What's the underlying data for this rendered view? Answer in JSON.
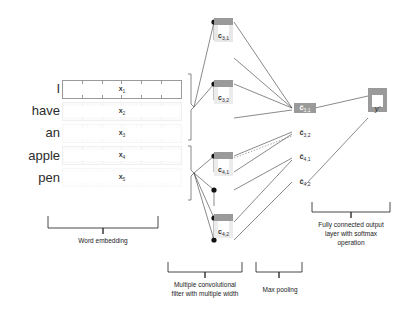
{
  "figure": {
    "background": "#ffffff",
    "ink": "#2f2f2f",
    "block_fill": "#9a9a9a",
    "embed_highlight": "#9a9a9a",
    "embed_faded": "#f2f2f2"
  },
  "input": {
    "words": [
      {
        "text": "I"
      },
      {
        "text": "have"
      },
      {
        "text": "an"
      },
      {
        "text": "apple"
      },
      {
        "text": "pen"
      }
    ]
  },
  "embedding": {
    "caption": "Word embedding",
    "rows": [
      {
        "label": "x",
        "sub": "1",
        "state": "highlighted"
      },
      {
        "label": "x",
        "sub": "2",
        "state": "faded"
      },
      {
        "label": "x",
        "sub": "3",
        "state": "faded"
      },
      {
        "label": "x",
        "sub": "4",
        "state": "faded"
      },
      {
        "label": "x",
        "sub": "5",
        "state": "faded"
      }
    ],
    "cells_per_row": 6
  },
  "convolution": {
    "caption_line1": "Multiple convolutional",
    "caption_line2": "filter with multiple width",
    "blocks": [
      {
        "label": "c",
        "sub": "3,1"
      },
      {
        "label": "c",
        "sub": "3,2"
      },
      {
        "label": "c",
        "sub": "4,1"
      },
      {
        "label": "c",
        "sub": "4,2"
      }
    ]
  },
  "pooling": {
    "caption": "Max pooling",
    "values": [
      {
        "label": "ĉ",
        "sub": "3,1",
        "highlighted": true
      },
      {
        "label": "ĉ",
        "sub": "3,2",
        "highlighted": false
      },
      {
        "label": "ĉ",
        "sub": "4,1",
        "highlighted": false
      },
      {
        "label": "ĉ",
        "sub": "4,2",
        "highlighted": false
      }
    ]
  },
  "output": {
    "caption_line1": "Fully connected output",
    "caption_line2": "layer with softmax",
    "caption_line3": "operation",
    "node_label": "y'"
  }
}
